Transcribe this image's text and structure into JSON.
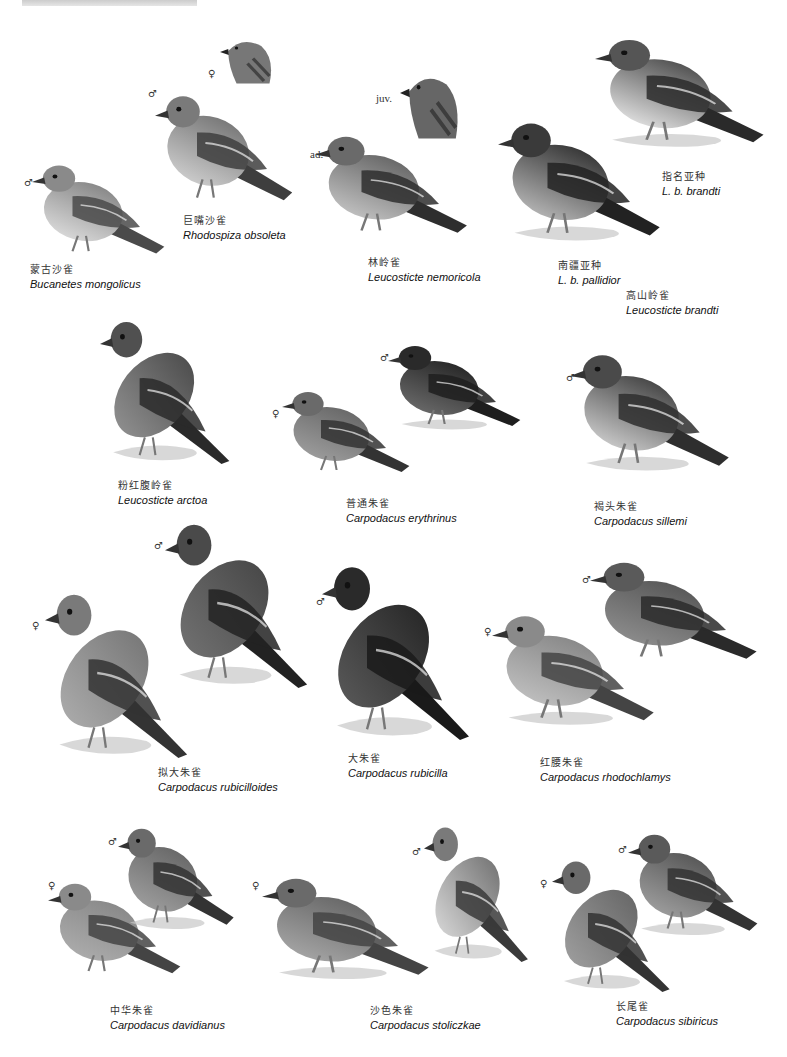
{
  "plate": {
    "species": [
      {
        "cn": "蒙古沙雀",
        "sci": "Bucanetes mongolicus"
      },
      {
        "cn": "巨嘴沙雀",
        "sci": "Rhodospiza obsoleta"
      },
      {
        "cn": "林岭雀",
        "sci": "Leucosticte nemoricola"
      },
      {
        "cn": "南疆亚种",
        "sci": "L. b. pallidior"
      },
      {
        "cn": "指名亚种",
        "sci": "L. b. brandti"
      },
      {
        "cn": "高山岭雀",
        "sci": "Leucosticte brandti"
      },
      {
        "cn": "粉红腹岭雀",
        "sci": "Leucosticte arctoa"
      },
      {
        "cn": "普通朱雀",
        "sci": "Carpodacus erythrinus"
      },
      {
        "cn": "褐头朱雀",
        "sci": "Carpodacus sillemi"
      },
      {
        "cn": "拟大朱雀",
        "sci": "Carpodacus rubicilloides"
      },
      {
        "cn": "大朱雀",
        "sci": "Carpodacus rubicilla"
      },
      {
        "cn": "红腰朱雀",
        "sci": "Carpodacus rhodochlamys"
      },
      {
        "cn": "中华朱雀",
        "sci": "Carpodacus davidianus"
      },
      {
        "cn": "沙色朱雀",
        "sci": "Carpodacus stoliczkae"
      },
      {
        "cn": "长尾雀",
        "sci": "Carpodacus sibiricus"
      }
    ],
    "marks": {
      "male": "♂",
      "female": "♀",
      "juv": "juv.",
      "ad": "ad."
    }
  }
}
